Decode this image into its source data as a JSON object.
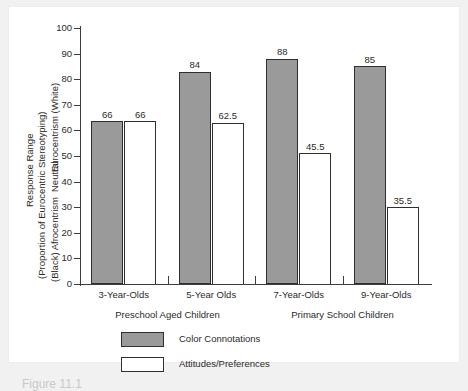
{
  "caption": "Figure 11.1",
  "chart_data": {
    "type": "bar",
    "title": "",
    "xlabel": "",
    "ylabel": "Response Range (Proportion of Eurocentric Stereotyping)",
    "ylim": [
      0,
      100
    ],
    "grid": false,
    "legend_position": "bottom-left",
    "y_axis": {
      "title_line1": "Response Range",
      "title_line2": "(Proportion of Eurocentric Stereotyping)",
      "range_top": "Eurocentrism (White)",
      "range_middle": "Neutral",
      "range_bottom": "(Black) Afrocentrism",
      "ticks": [
        0,
        10,
        20,
        30,
        40,
        50,
        60,
        70,
        80,
        90,
        100
      ]
    },
    "categories": [
      "3-Year-Olds",
      "5-Year Olds",
      "7-Year-Olds",
      "9-Year-Olds"
    ],
    "groups": [
      {
        "label": "Preschool Aged Children",
        "categories": [
          "3-Year-Olds",
          "5-Year Olds"
        ]
      },
      {
        "label": "Primary School Children",
        "categories": [
          "7-Year-Olds",
          "9-Year-Olds"
        ]
      }
    ],
    "series": [
      {
        "name": "Color Connotations",
        "style": "filled",
        "color": "#9a9a9a",
        "labels": [
          "66",
          "84",
          "88",
          "85"
        ],
        "values": [
          66,
          84,
          88,
          85
        ],
        "plotted_heights": [
          63.5,
          83,
          88,
          85
        ]
      },
      {
        "name": "Attitudes/Preferences",
        "style": "hollow",
        "color": "#ffffff",
        "labels": [
          "66",
          "62.5",
          "45.5",
          "35.5"
        ],
        "values": [
          66,
          62.5,
          45.5,
          35.5
        ],
        "plotted_heights": [
          63.5,
          63,
          51,
          30
        ]
      }
    ]
  },
  "legend": {
    "items": [
      {
        "label": "Color Connotations",
        "style": "filled"
      },
      {
        "label": "Attitudes/Preferences",
        "style": "hollow"
      }
    ]
  }
}
